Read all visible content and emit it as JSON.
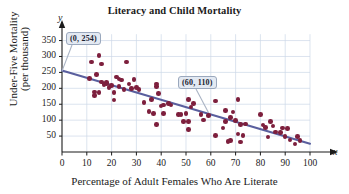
{
  "chart_data": {
    "type": "scatter",
    "title": "Literacy and Child Mortality",
    "xlabel": "Percentage of Adult Females Who Are Literate",
    "ylabel_line1": "Under-Five Mortality",
    "ylabel_line2": "(per thousand)",
    "x_axis_letter": "x",
    "y_axis_letter": "y",
    "xlim": [
      0,
      105
    ],
    "ylim": [
      0,
      380
    ],
    "xticks": [
      0,
      10,
      20,
      30,
      40,
      50,
      60,
      70,
      80,
      90,
      100
    ],
    "yticks": [
      50,
      100,
      150,
      200,
      250,
      300,
      350
    ],
    "grid": true,
    "grid_color": "#cdd9e8",
    "point_color": "#7d1f3d",
    "line_color": "#5a5f9e",
    "axis_color": "#1b1b1b",
    "annotations": [
      {
        "label": "(0, 254)",
        "point": [
          0,
          254
        ]
      },
      {
        "label": "(60, 110)",
        "point": [
          60,
          110
        ]
      }
    ],
    "trendline": {
      "x0": 0,
      "y0": 256,
      "x1": 100,
      "y1": 26
    },
    "points": [
      [
        11,
        231
      ],
      [
        12,
        283
      ],
      [
        13,
        178
      ],
      [
        13,
        189
      ],
      [
        14,
        243
      ],
      [
        15,
        303
      ],
      [
        15,
        186
      ],
      [
        16,
        220
      ],
      [
        16,
        276
      ],
      [
        17,
        212
      ],
      [
        18,
        218
      ],
      [
        18,
        216
      ],
      [
        19,
        203
      ],
      [
        20,
        208
      ],
      [
        21,
        163
      ],
      [
        21,
        186
      ],
      [
        22,
        235
      ],
      [
        23,
        229
      ],
      [
        23,
        205
      ],
      [
        24,
        226
      ],
      [
        25,
        197
      ],
      [
        26,
        282
      ],
      [
        27,
        214
      ],
      [
        28,
        200
      ],
      [
        29,
        227
      ],
      [
        30,
        203
      ],
      [
        31,
        196
      ],
      [
        33,
        155
      ],
      [
        35,
        128
      ],
      [
        36,
        165
      ],
      [
        37,
        120
      ],
      [
        38,
        87
      ],
      [
        38,
        206
      ],
      [
        38,
        213
      ],
      [
        39,
        183
      ],
      [
        40,
        144
      ],
      [
        41,
        148
      ],
      [
        41,
        121
      ],
      [
        43,
        152
      ],
      [
        44,
        148
      ],
      [
        47,
        118
      ],
      [
        48,
        117
      ],
      [
        49,
        96
      ],
      [
        50,
        121
      ],
      [
        51,
        95
      ],
      [
        51,
        164
      ],
      [
        51,
        70
      ],
      [
        52,
        141
      ],
      [
        53,
        152
      ],
      [
        56,
        118
      ],
      [
        57,
        100
      ],
      [
        59,
        115
      ],
      [
        62,
        52
      ],
      [
        62,
        160
      ],
      [
        65,
        76
      ],
      [
        66,
        95
      ],
      [
        66,
        130
      ],
      [
        67,
        33
      ],
      [
        68,
        36
      ],
      [
        68,
        108
      ],
      [
        69,
        126
      ],
      [
        70,
        98
      ],
      [
        71,
        56
      ],
      [
        71,
        165
      ],
      [
        72,
        32
      ],
      [
        72,
        86
      ],
      [
        73,
        52
      ],
      [
        74,
        88
      ],
      [
        80,
        118
      ],
      [
        81,
        85
      ],
      [
        82,
        77
      ],
      [
        83,
        47
      ],
      [
        84,
        95
      ],
      [
        85,
        82
      ],
      [
        86,
        63
      ],
      [
        88,
        62
      ],
      [
        89,
        75
      ],
      [
        90,
        48
      ],
      [
        91,
        73
      ],
      [
        92,
        38
      ],
      [
        94,
        25
      ],
      [
        95,
        48
      ],
      [
        96,
        37
      ]
    ]
  }
}
